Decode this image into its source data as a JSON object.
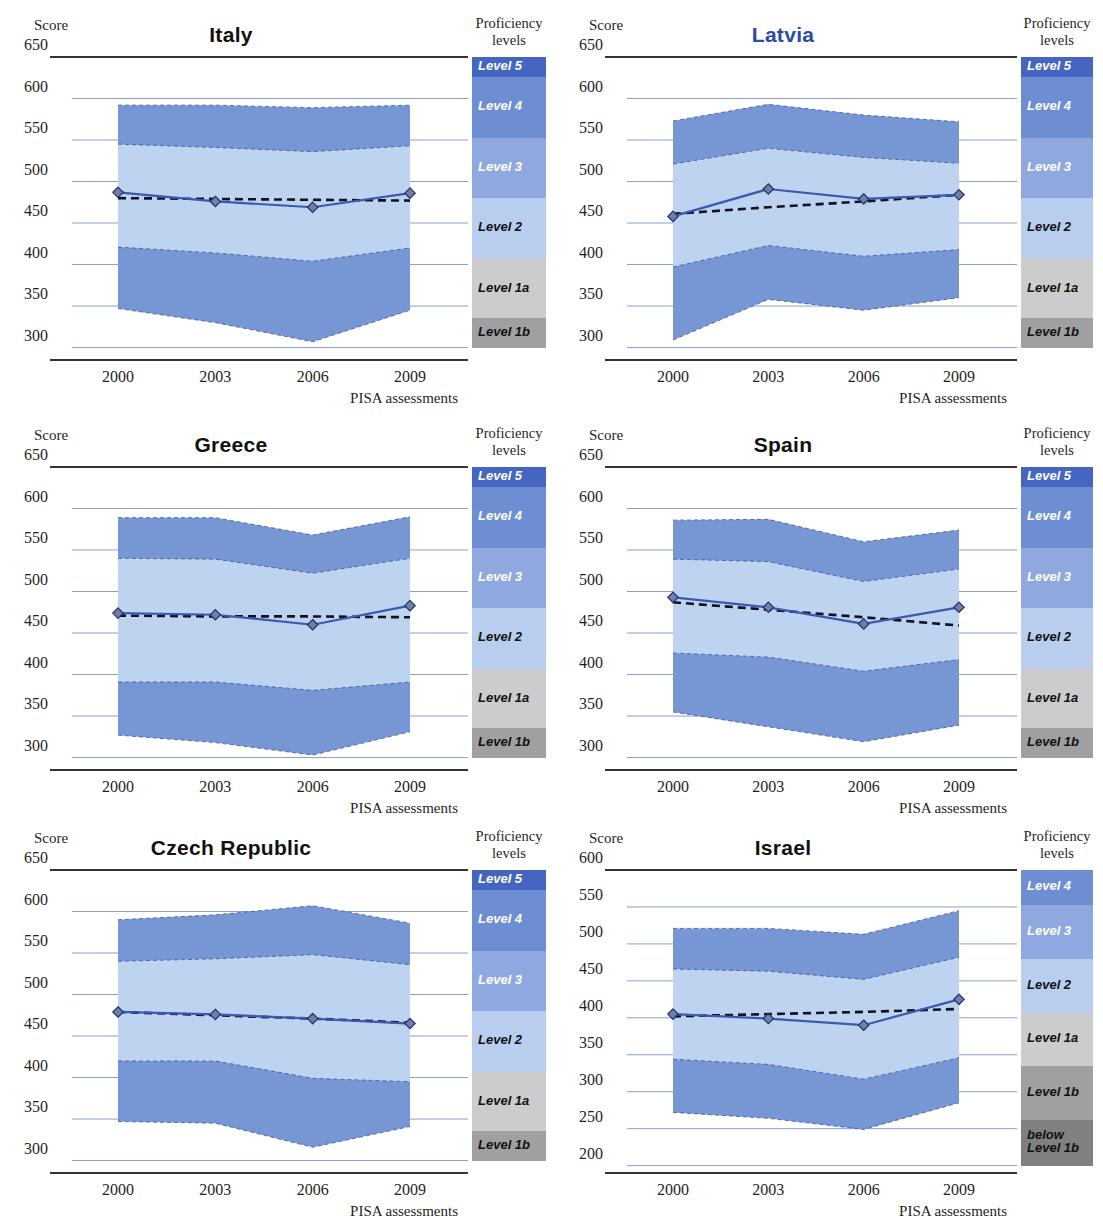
{
  "axis_labels": {
    "score_label": "Score",
    "xaxis_title": "PISA assessments",
    "proficiency_header_line1": "Proficiency",
    "proficiency_header_line2": "levels"
  },
  "colors": {
    "band_outer": "#7796d4",
    "band_inner": "#bed3ef",
    "mean_line": "#3a59b0",
    "trend_line": "#111122",
    "gridline": "#6f8fd0",
    "axis_line": "#333333",
    "title_default": "#111111",
    "title_highlight": "#2b4aa8",
    "level5": "#4465c0",
    "level4": "#6e8ed4",
    "level3": "#8fa9e0",
    "level2": "#b9cdef",
    "level1a": "#cccccc",
    "level1b": "#a0a0a0",
    "below1b": "#808080"
  },
  "proficiency_levels_standard": [
    {
      "name": "Level 5",
      "min": 626,
      "max": 650,
      "color": "#4465c0",
      "text": "#ffffff"
    },
    {
      "name": "Level 4",
      "min": 553,
      "max": 626,
      "color": "#6e8ed4",
      "text": "#ffffff"
    },
    {
      "name": "Level 3",
      "min": 480,
      "max": 553,
      "color": "#8fa9e0",
      "text": "#ffffff"
    },
    {
      "name": "Level 2",
      "min": 407,
      "max": 480,
      "color": "#b9cdef",
      "text": "#111111"
    },
    {
      "name": "Level 1a",
      "min": 335,
      "max": 407,
      "color": "#cccccc",
      "text": "#111111"
    },
    {
      "name": "Level 1b",
      "min": 300,
      "max": 335,
      "color": "#a0a0a0",
      "text": "#111111"
    }
  ],
  "proficiency_levels_israel": [
    {
      "name": "Level 4",
      "min": 553,
      "max": 600,
      "color": "#6e8ed4",
      "text": "#ffffff"
    },
    {
      "name": "Level 3",
      "min": 480,
      "max": 553,
      "color": "#8fa9e0",
      "text": "#ffffff"
    },
    {
      "name": "Level 2",
      "min": 407,
      "max": 480,
      "color": "#b9cdef",
      "text": "#111111"
    },
    {
      "name": "Level 1a",
      "min": 335,
      "max": 407,
      "color": "#cccccc",
      "text": "#111111"
    },
    {
      "name": "Level 1b",
      "min": 262,
      "max": 335,
      "color": "#a0a0a0",
      "text": "#111111"
    },
    {
      "name": "below\nLevel 1b",
      "min": 200,
      "max": 262,
      "color": "#808080",
      "text": "#111111"
    }
  ],
  "chart_data": [
    {
      "type": "area",
      "title": "Italy",
      "title_highlight": false,
      "xlabel": "PISA assessments",
      "ylabel": "Score",
      "categories": [
        "2000",
        "2003",
        "2006",
        "2009"
      ],
      "x": [
        2000,
        2003,
        2006,
        2009
      ],
      "ylim": [
        285,
        650
      ],
      "yticks": [
        300,
        350,
        400,
        450,
        500,
        550,
        600,
        650
      ],
      "grid": true,
      "legend_position": "right",
      "series": [
        {
          "name": "95th percentile",
          "values": [
            592,
            592,
            589,
            592
          ]
        },
        {
          "name": "75th percentile",
          "values": [
            545,
            541,
            536,
            543
          ]
        },
        {
          "name": "25th percentile",
          "values": [
            421,
            414,
            404,
            420
          ]
        },
        {
          "name": "5th percentile",
          "values": [
            347,
            330,
            307,
            345
          ]
        },
        {
          "name": "Mean score",
          "values": [
            487,
            476,
            469,
            486
          ]
        },
        {
          "name": "Trend line",
          "values": [
            480,
            479,
            478,
            477
          ]
        }
      ]
    },
    {
      "type": "area",
      "title": "Latvia",
      "title_highlight": true,
      "xlabel": "PISA assessments",
      "ylabel": "Score",
      "categories": [
        "2000",
        "2003",
        "2006",
        "2009"
      ],
      "x": [
        2000,
        2003,
        2006,
        2009
      ],
      "ylim": [
        285,
        650
      ],
      "yticks": [
        300,
        350,
        400,
        450,
        500,
        550,
        600,
        650
      ],
      "grid": true,
      "legend_position": "right",
      "series": [
        {
          "name": "95th percentile",
          "values": [
            573,
            593,
            580,
            572
          ]
        },
        {
          "name": "75th percentile",
          "values": [
            521,
            540,
            529,
            522
          ]
        },
        {
          "name": "25th percentile",
          "values": [
            397,
            423,
            410,
            418
          ]
        },
        {
          "name": "5th percentile",
          "values": [
            309,
            358,
            345,
            360
          ]
        },
        {
          "name": "Mean score",
          "values": [
            458,
            491,
            479,
            484
          ]
        },
        {
          "name": "Trend line",
          "values": [
            461,
            469,
            476,
            484
          ]
        }
      ]
    },
    {
      "type": "area",
      "title": "Greece",
      "title_highlight": false,
      "xlabel": "PISA assessments",
      "ylabel": "Score",
      "categories": [
        "2000",
        "2003",
        "2006",
        "2009"
      ],
      "x": [
        2000,
        2003,
        2006,
        2009
      ],
      "ylim": [
        285,
        650
      ],
      "yticks": [
        300,
        350,
        400,
        450,
        500,
        550,
        600,
        650
      ],
      "grid": true,
      "legend_position": "right",
      "series": [
        {
          "name": "95th percentile",
          "values": [
            589,
            589,
            568,
            590
          ]
        },
        {
          "name": "75th percentile",
          "values": [
            540,
            539,
            522,
            540
          ]
        },
        {
          "name": "25th percentile",
          "values": [
            391,
            391,
            381,
            391
          ]
        },
        {
          "name": "5th percentile",
          "values": [
            327,
            318,
            303,
            331
          ]
        },
        {
          "name": "Mean score",
          "values": [
            474,
            472,
            460,
            483
          ]
        },
        {
          "name": "Trend line",
          "values": [
            471,
            470,
            470,
            469
          ]
        }
      ]
    },
    {
      "type": "area",
      "title": "Spain",
      "title_highlight": false,
      "xlabel": "PISA assessments",
      "ylabel": "Score",
      "categories": [
        "2000",
        "2003",
        "2006",
        "2009"
      ],
      "x": [
        2000,
        2003,
        2006,
        2009
      ],
      "ylim": [
        285,
        650
      ],
      "yticks": [
        300,
        350,
        400,
        450,
        500,
        550,
        600,
        650
      ],
      "grid": true,
      "legend_position": "right",
      "series": [
        {
          "name": "95th percentile",
          "values": [
            586,
            587,
            560,
            574
          ]
        },
        {
          "name": "75th percentile",
          "values": [
            539,
            536,
            512,
            527
          ]
        },
        {
          "name": "25th percentile",
          "values": [
            426,
            421,
            404,
            418
          ]
        },
        {
          "name": "5th percentile",
          "values": [
            355,
            337,
            319,
            339
          ]
        },
        {
          "name": "Mean score",
          "values": [
            493,
            481,
            461,
            481
          ]
        },
        {
          "name": "Trend line",
          "values": [
            487,
            478,
            469,
            459
          ]
        }
      ]
    },
    {
      "type": "area",
      "title": "Czech Republic",
      "title_highlight": false,
      "xlabel": "PISA assessments",
      "ylabel": "Score",
      "categories": [
        "2000",
        "2003",
        "2006",
        "2009"
      ],
      "x": [
        2000,
        2003,
        2006,
        2009
      ],
      "ylim": [
        285,
        650
      ],
      "yticks": [
        300,
        350,
        400,
        450,
        500,
        550,
        600,
        650
      ],
      "grid": true,
      "legend_position": "right",
      "series": [
        {
          "name": "95th percentile",
          "values": [
            590,
            596,
            607,
            586
          ]
        },
        {
          "name": "75th percentile",
          "values": [
            540,
            543,
            548,
            536
          ]
        },
        {
          "name": "25th percentile",
          "values": [
            420,
            420,
            399,
            395
          ]
        },
        {
          "name": "5th percentile",
          "values": [
            347,
            345,
            316,
            341
          ]
        },
        {
          "name": "Mean score",
          "values": [
            479,
            476,
            471,
            465
          ]
        },
        {
          "name": "Trend line",
          "values": [
            479,
            475,
            471,
            466
          ]
        }
      ]
    },
    {
      "type": "area",
      "title": "Israel",
      "title_highlight": false,
      "xlabel": "PISA assessments",
      "ylabel": "Score",
      "categories": [
        "2000",
        "2003",
        "2006",
        "2009"
      ],
      "x": [
        2000,
        2003,
        2006,
        2009
      ],
      "ylim": [
        190,
        600
      ],
      "yticks": [
        200,
        250,
        300,
        350,
        400,
        450,
        500,
        550,
        600
      ],
      "grid": true,
      "legend_position": "right",
      "series": [
        {
          "name": "95th percentile",
          "values": [
            521,
            521,
            513,
            545
          ]
        },
        {
          "name": "75th percentile",
          "values": [
            466,
            463,
            452,
            482
          ]
        },
        {
          "name": "25th percentile",
          "values": [
            344,
            337,
            317,
            346
          ]
        },
        {
          "name": "5th percentile",
          "values": [
            272,
            264,
            249,
            285
          ]
        },
        {
          "name": "Mean score",
          "values": [
            405,
            399,
            390,
            425
          ]
        },
        {
          "name": "Trend line",
          "values": [
            402,
            405,
            408,
            412
          ]
        }
      ]
    }
  ]
}
